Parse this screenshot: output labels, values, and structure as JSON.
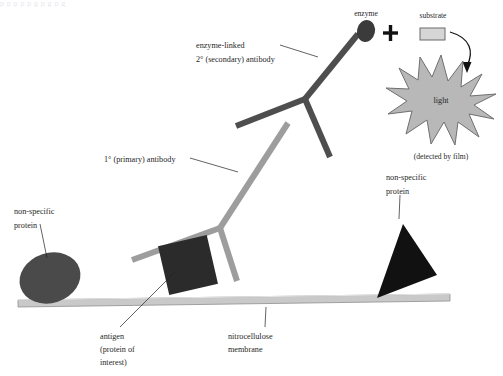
{
  "figure": {
    "type": "scientific-diagram",
    "background_color": "#ffffff",
    "top_cut_text": "p   p          p   p      p  g        p  g    p  g"
  },
  "labels": {
    "enzyme": "enzyme",
    "substrate": "substrate",
    "light": "light",
    "detected_by_film": "(detected by film)",
    "secondary_antibody_line1": "enzyme-linked",
    "secondary_antibody_line2": "2° (secondary) antibody",
    "primary_antibody": "1° (primary)  antibody",
    "nonspecific_protein_left_line1": "non-specific",
    "nonspecific_protein_left_line2": "protein",
    "nonspecific_protein_right_line1": "non-specific",
    "nonspecific_protein_right_line2": "protein",
    "antigen_line1": "antigen",
    "antigen_line2": "(protein of",
    "antigen_line3": "interest)",
    "membrane_line1": "nitrocellulose",
    "membrane_line2": "membrane",
    "plus_sign": "+"
  },
  "colors": {
    "membrane_fill": "#c9c9c9",
    "membrane_edge": "#8f8f8f",
    "primary_antibody": "#9d9d9d",
    "secondary_antibody": "#4e4e4e",
    "enzyme_fill": "#3b3b3b",
    "substrate_fill": "#d6d6d6",
    "substrate_stroke": "#6a6a6a",
    "antigen_fill": "#2b2b2b",
    "nonspecific_left_fill": "#4a4a4a",
    "nonspecific_right_fill": "#111111",
    "light_fill": "#b8b8b8",
    "light_stroke": "#6f6f6f",
    "text": "#1f1f1f",
    "leader_line": "#1f1f1f"
  },
  "shapes": {
    "membrane": {
      "x1": 18,
      "y1": 303,
      "x2": 450,
      "y2": 297,
      "thickness": 7
    },
    "nonspecific_protein_left": {
      "cx": 50,
      "cy": 279,
      "rx": 31,
      "ry": 25,
      "rotation": -18
    },
    "antigen_square": {
      "cx": 188,
      "cy": 265,
      "size": 50,
      "rotation": -13
    },
    "nonspecific_protein_right": {
      "cx": 403,
      "cy": 267,
      "rotation": 22
    },
    "primary_antibody": {
      "junction_x": 220,
      "junction_y": 228,
      "arm_left_x": 132,
      "arm_left_y": 260,
      "arm_right_x": 236,
      "arm_right_y": 281,
      "stem_x": 288,
      "stem_y": 123,
      "stroke_width": 6
    },
    "secondary_antibody": {
      "junction_x": 305,
      "junction_y": 99,
      "arm_left_x": 236,
      "arm_left_y": 126,
      "arm_right_x": 330,
      "arm_right_y": 157,
      "stem_x": 358,
      "stem_y": 34,
      "stroke_width": 6
    },
    "enzyme": {
      "cx": 366,
      "cy": 31,
      "rx": 9,
      "ry": 11
    },
    "plus": {
      "cx": 390,
      "cy": 33
    },
    "substrate": {
      "x": 420,
      "y": 28,
      "w": 24,
      "h": 12
    },
    "light_star": {
      "cx": 441,
      "cy": 99,
      "outer_r": 44,
      "inner_r": 22,
      "points": 12
    },
    "arrow": {
      "start_x": 452,
      "start_y": 34,
      "end_x": 466,
      "end_y": 68
    }
  }
}
